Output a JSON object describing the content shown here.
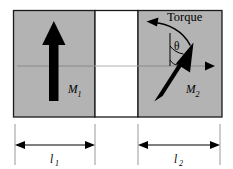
{
  "colors": {
    "layer_fill": "#b3b3b3",
    "layer_stroke": "#1a1a1a",
    "spacer_fill": "#ffffff",
    "axis_line": "#808080",
    "arrow_fill": "#000000",
    "dimension_line": "#000000",
    "extension_line": "#999999",
    "text": "#000000"
  },
  "layers": {
    "left": {
      "name": "left-magnetic-layer",
      "magnetization_label": "M",
      "magnetization_subscript": "1",
      "magnetization_direction_deg": 90,
      "x": 13,
      "y": 10,
      "width": 82,
      "height": 107
    },
    "spacer": {
      "name": "spacer-layer",
      "x": 95,
      "y": 10,
      "width": 43,
      "height": 107
    },
    "right": {
      "name": "right-magnetic-layer",
      "magnetization_label": "M",
      "magnetization_subscript": "2",
      "magnetization_direction_deg": 56,
      "x": 138,
      "y": 10,
      "width": 84,
      "height": 107
    }
  },
  "annotations": {
    "torque_label": "Torque",
    "angle_label": "θ",
    "axis_label_left": "",
    "axis_label_right": ""
  },
  "dimensions": [
    {
      "name": "dimension-l1",
      "label": "l",
      "subscript": "1",
      "x_start": 15,
      "x_end": 95,
      "y": 145
    },
    {
      "name": "dimension-l2",
      "label": "l",
      "subscript": "2",
      "x_start": 138,
      "x_end": 220,
      "y": 145
    }
  ]
}
